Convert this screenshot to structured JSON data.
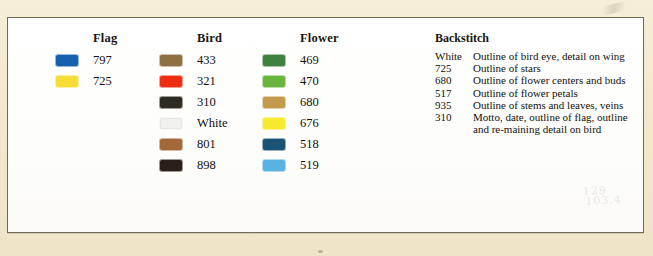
{
  "document": {
    "type": "cross-stitch-floss-key",
    "page_background": "#f2e8cd",
    "card_background": "#fdfdfb",
    "card_border_color": "#6f6a58"
  },
  "floss_columns": [
    {
      "header": "Flag",
      "rows": [
        {
          "code": "797",
          "color": "#1661ae",
          "name": "blue"
        },
        {
          "code": "725",
          "color": "#f6dd36",
          "name": "yellow"
        }
      ]
    },
    {
      "header": "Bird",
      "rows": [
        {
          "code": "433",
          "color": "#8e7042",
          "name": "medium-brown"
        },
        {
          "code": "321",
          "color": "#ef2d13",
          "name": "red"
        },
        {
          "code": "310",
          "color": "#2f2a22",
          "name": "black"
        },
        {
          "code": "White",
          "color": "#f1f1ee",
          "name": "white",
          "pale": true
        },
        {
          "code": "801",
          "color": "#a2683a",
          "name": "dark-brown"
        },
        {
          "code": "898",
          "color": "#2b2019",
          "name": "very-dark-brown"
        }
      ]
    },
    {
      "header": "Flower",
      "rows": [
        {
          "code": "469",
          "color": "#3f8240",
          "name": "dark-green"
        },
        {
          "code": "470",
          "color": "#68b43f",
          "name": "medium-green"
        },
        {
          "code": "680",
          "color": "#c49a4c",
          "name": "golden-tan"
        },
        {
          "code": "676",
          "color": "#f7e92b",
          "name": "bright-yellow"
        },
        {
          "code": "518",
          "color": "#1b5375",
          "name": "dark-teal-blue"
        },
        {
          "code": "519",
          "color": "#59b2e2",
          "name": "light-sky-blue"
        }
      ]
    }
  ],
  "backstitch": {
    "header": "Backstitch",
    "rows": [
      {
        "code": "White",
        "description": "Outline of bird eye, detail on wing"
      },
      {
        "code": "725",
        "description": "Outline of stars"
      },
      {
        "code": "680",
        "description": "Outline of flower centers and buds"
      },
      {
        "code": "517",
        "description": "Outline of flower petals"
      },
      {
        "code": "935",
        "description": "Outline of stems and leaves, veins"
      },
      {
        "code": "310",
        "description": "Motto, date, outline of flag, outline and re-maining detail on bird"
      }
    ]
  },
  "annotations": {
    "pencil_line1": "129",
    "pencil_line2": "103.4"
  }
}
